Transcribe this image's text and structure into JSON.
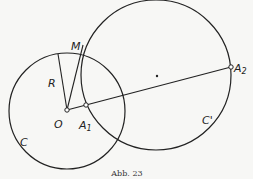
{
  "figure": {
    "caption": "Abb. 23",
    "colors": {
      "stroke": "#222222",
      "background": "#f7f7f5"
    },
    "circles": [
      {
        "id": "C",
        "label": "C",
        "cx": 67,
        "cy": 111,
        "r": 58
      },
      {
        "id": "C_prime",
        "label": "C'",
        "cx": 156,
        "cy": 75,
        "r": 75
      }
    ],
    "points": {
      "O": {
        "label": "O",
        "x": 67,
        "y": 110
      },
      "A1": {
        "label": "A",
        "sub": "1",
        "x": 86,
        "y": 105
      },
      "A2": {
        "label": "A",
        "sub": "2",
        "x": 231,
        "y": 67
      },
      "M": {
        "label": "M",
        "x": 83,
        "y": 45
      },
      "R_end": {
        "x": 58,
        "y": 54
      },
      "center_C_prime": {
        "x": 157,
        "y": 76
      }
    },
    "segments": [
      {
        "from": "O",
        "to": "A2"
      },
      {
        "from": "O",
        "to": "M"
      },
      {
        "from": "O",
        "to": "R_end",
        "label": "R"
      }
    ],
    "labels": {
      "M": "M",
      "R": "R",
      "O": "O",
      "A1_main": "A",
      "A1_sub": "1",
      "A2_main": "A",
      "A2_sub": "2",
      "C": "C",
      "C_prime": "C'"
    }
  }
}
